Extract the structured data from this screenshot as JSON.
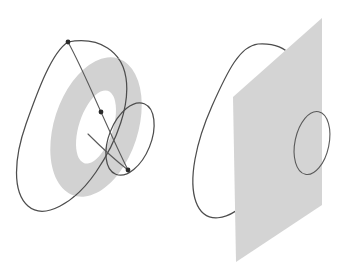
{
  "figure": {
    "canvas": {
      "width": 339,
      "height": 271,
      "background": "#ffffff"
    },
    "panels": [
      {
        "id": "left",
        "name": "annulus-panel",
        "caption": "",
        "shapes": [
          {
            "name": "large-loop",
            "kind": "closed-curve",
            "stroke": "#4d4d4d",
            "stroke_width": 1.25
          },
          {
            "name": "annulus",
            "kind": "filled-annulus",
            "fill": "#d2d2d2",
            "center": [
              96,
              127
            ],
            "outer_rx": 42,
            "outer_ry": 72,
            "inner_rx": 17,
            "inner_ry": 38,
            "rotation_deg": 18
          },
          {
            "name": "small-loop",
            "kind": "closed-curve",
            "stroke": "#4d4d4d",
            "center": [
              130,
              139
            ],
            "rx": 21,
            "ry": 38,
            "rotation_deg": 22
          },
          {
            "name": "chord-upper",
            "kind": "line",
            "from": [
              68,
              42
            ],
            "to": [
              101,
              112
            ]
          },
          {
            "name": "chord-lower",
            "kind": "line",
            "from": [
              101,
              112
            ],
            "to": [
              128,
              170
            ]
          }
        ],
        "markers": [
          {
            "name": "marker-top",
            "x": 68,
            "y": 42,
            "r": 2.4,
            "color": "#2b2b2b"
          },
          {
            "name": "marker-middle",
            "x": 101,
            "y": 112,
            "r": 2.4,
            "color": "#2b2b2b"
          },
          {
            "name": "marker-bottom",
            "x": 128,
            "y": 170,
            "r": 2.4,
            "color": "#2b2b2b"
          }
        ]
      },
      {
        "id": "right",
        "name": "plane-panel",
        "caption": "",
        "shapes": [
          {
            "name": "large-loop",
            "kind": "closed-curve",
            "stroke": "#4d4d4d",
            "stroke_width": 1.25
          },
          {
            "name": "plane",
            "kind": "filled-parallelogram",
            "fill": "#d4d4d4",
            "corners": [
              [
                322,
                18
              ],
              [
                322,
                205
              ],
              [
                236,
                262
              ],
              [
                233,
                97
              ]
            ]
          },
          {
            "name": "small-circle",
            "kind": "closed-curve",
            "stroke": "#6b6b6b",
            "center": [
              312,
              143
            ],
            "rx": 17,
            "ry": 32,
            "rotation_deg": 12
          }
        ],
        "markers": []
      }
    ],
    "colors": {
      "annulus_fill": "#d2d2d2",
      "plane_fill": "#d4d4d4",
      "curve_stroke": "#4d4d4d",
      "marker_fill": "#2b2b2b",
      "background": "#ffffff"
    }
  }
}
